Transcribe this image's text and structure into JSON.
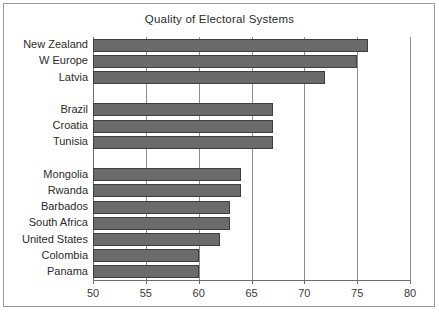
{
  "chart_data": {
    "type": "bar",
    "orientation": "horizontal",
    "title": "Quality of Electoral Systems",
    "xlabel": "",
    "ylabel": "",
    "xlim": [
      50,
      80
    ],
    "xticks": [
      50,
      55,
      60,
      65,
      70,
      75,
      80
    ],
    "xtick_labels": [
      "50",
      "55",
      "60",
      "65",
      "70",
      "75",
      "80"
    ],
    "grid": true,
    "grid_axis": "x",
    "legend": false,
    "bar_color": "#6b6b6b",
    "bar_edge_color": "#3f3f3f",
    "categories": [
      "New Zealand",
      "W Europe",
      "Latvia",
      "Brazil",
      "Croatia",
      "Tunisia",
      "Mongolia",
      "Rwanda",
      "Barbados",
      "South Africa",
      "United States",
      "Colombia",
      "Panama"
    ],
    "values": [
      76,
      75,
      72,
      67,
      67,
      67,
      64,
      64,
      63,
      63,
      62,
      60,
      60
    ],
    "groups": [
      {
        "name": "top",
        "categories": [
          "New Zealand",
          "W Europe",
          "Latvia"
        ]
      },
      {
        "name": "middle",
        "categories": [
          "Brazil",
          "Croatia",
          "Tunisia"
        ]
      },
      {
        "name": "bottom",
        "categories": [
          "Mongolia",
          "Rwanda",
          "Barbados",
          "South Africa",
          "United States",
          "Colombia",
          "Panama"
        ]
      }
    ],
    "rows": [
      {
        "label": "New Zealand",
        "value": 76,
        "gap_after": false
      },
      {
        "label": "W Europe",
        "value": 75,
        "gap_after": false
      },
      {
        "label": "Latvia",
        "value": 72,
        "gap_after": true
      },
      {
        "label": "Brazil",
        "value": 67,
        "gap_after": false
      },
      {
        "label": "Croatia",
        "value": 67,
        "gap_after": false
      },
      {
        "label": "Tunisia",
        "value": 67,
        "gap_after": true
      },
      {
        "label": "Mongolia",
        "value": 64,
        "gap_after": false
      },
      {
        "label": "Rwanda",
        "value": 64,
        "gap_after": false
      },
      {
        "label": "Barbados",
        "value": 63,
        "gap_after": false
      },
      {
        "label": "South Africa",
        "value": 63,
        "gap_after": false
      },
      {
        "label": "United States",
        "value": 62,
        "gap_after": false
      },
      {
        "label": "Colombia",
        "value": 60,
        "gap_after": false
      },
      {
        "label": "Panama",
        "value": 60,
        "gap_after": false
      }
    ]
  },
  "colors": {
    "frame": "#9a9a9a",
    "axis": "#6d6d6d",
    "gridline": "#8d8d8d",
    "text": "#2b2b2b",
    "background": "#ffffff"
  }
}
